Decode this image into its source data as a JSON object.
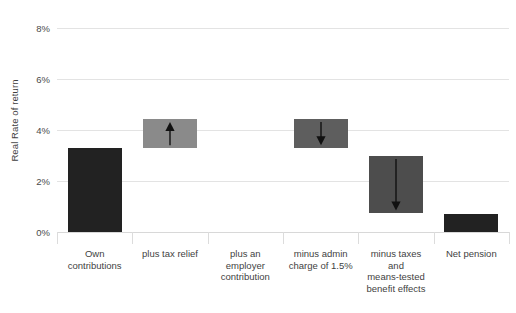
{
  "chart_data": {
    "type": "bar",
    "title": "",
    "subtitle": "",
    "xlabel": "",
    "ylabel": "Real Rate of return",
    "ylim": [
      0,
      8
    ],
    "yunit": "%",
    "ytick_labels": [
      "0%",
      "2%",
      "4%",
      "6%",
      "8%"
    ],
    "ytick_values": [
      0,
      2,
      4,
      6,
      8
    ],
    "grid": true,
    "legend": false,
    "waterfall": true,
    "categories": [
      "Own contributions",
      "plus tax relief",
      "plus an employer contribution",
      "minus admin charge of 1.5%",
      "minus taxes and means-tested benefit effects",
      "Net pension"
    ],
    "bars": [
      {
        "label": "Own contributions",
        "label_lines": [
          "Own",
          "contributions"
        ],
        "base": 0,
        "top": 3.3,
        "value": 3.3,
        "color": "#222222",
        "kind": "total",
        "arrow": "none"
      },
      {
        "label": "plus tax relief",
        "label_lines": [
          "plus tax relief"
        ],
        "base": 3.3,
        "top": 4.45,
        "value": 1.15,
        "color": "#8a8a8a",
        "kind": "increase",
        "arrow": "up"
      },
      {
        "label": "plus an employer contribution",
        "label_lines": [
          "plus an",
          "employer",
          "contribution"
        ],
        "base": 4.45,
        "top": 4.45,
        "value": 0,
        "color": "#8a8a8a",
        "kind": "none",
        "arrow": "none"
      },
      {
        "label": "minus admin charge of 1.5%",
        "label_lines": [
          "minus admin",
          "charge of 1.5%"
        ],
        "base": 3.3,
        "top": 4.45,
        "value": -1.15,
        "color": "#5e5e5e",
        "kind": "decrease",
        "arrow": "down"
      },
      {
        "label": "minus taxes and means-tested benefit effects",
        "label_lines": [
          "minus taxes",
          "and",
          "means-tested",
          "benefit effects"
        ],
        "base": 0.75,
        "top": 3.0,
        "value": -2.25,
        "color": "#4d4d4d",
        "kind": "decrease",
        "arrow": "down"
      },
      {
        "label": "Net pension",
        "label_lines": [
          "Net pension"
        ],
        "base": 0,
        "top": 0.72,
        "value": 0.72,
        "color": "#222222",
        "kind": "total",
        "arrow": "none"
      }
    ],
    "colors": {
      "total_bar": "#222222",
      "step_bar": "#8a8a8a",
      "gridline": "#e3e3e3",
      "axis_text": "#3f3f3f",
      "background": "#ffffff",
      "arrow": "#111111"
    }
  }
}
